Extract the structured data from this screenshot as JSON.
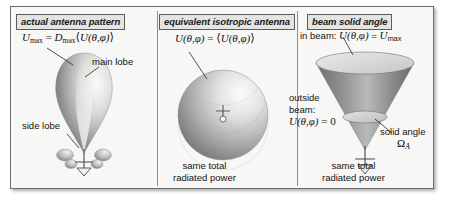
{
  "panels": [
    {
      "id": "actual-antenna-pattern",
      "heading": "actual antenna pattern",
      "formula": {
        "lhs_symbol": "U",
        "lhs_sub": "max",
        "equals": "=",
        "rhs_symbol": "D",
        "rhs_sub": "max",
        "average_open": "⟨",
        "average_arg": "U(θ,φ)",
        "average_close": "⟩",
        "full": "U_max = D_max ⟨U(θ,φ)⟩"
      },
      "labels": {
        "main_lobe": "main lobe",
        "side_lobe": "side lobe"
      },
      "caption": ""
    },
    {
      "id": "equivalent-isotropic-antenna",
      "heading": "equivalent isotropic antenna",
      "formula": {
        "lhs": "U(θ,φ)",
        "equals": "=",
        "average_open": "⟨",
        "average_arg": "U(θ,φ)",
        "average_close": "⟩",
        "full": "U(θ,φ) = ⟨U(θ,φ)⟩"
      },
      "caption_line1": "same total",
      "caption_line2": "radiated power"
    },
    {
      "id": "beam-solid-angle",
      "heading": "beam solid angle",
      "in_beam": {
        "prefix": "in beam: ",
        "expr": "U(θ,φ)",
        "equals": " = ",
        "value_symbol": "U",
        "value_sub": "max",
        "full": "in beam: U(θ,φ) = U_max"
      },
      "outside_beam": {
        "line1": "outside",
        "line2": "beam:",
        "expr": "U(θ,φ)",
        "equals": " = 0",
        "full": "outside beam: U(θ,φ) = 0"
      },
      "solid_angle": {
        "label": "solid angle",
        "symbol": "Ω",
        "sub": "A"
      },
      "caption_line1": "same total",
      "caption_line2": "radiated power"
    }
  ],
  "colors": {
    "frame_border": "#6d6d6d",
    "panel_bg": "#f7f7f5",
    "chip_bg": "#e4e4e2",
    "chip_border": "#5c5c5c",
    "text": "#141414",
    "lobe_dark": "#6e6e6e",
    "lobe_light": "#f2f2f0",
    "leader": "#3a3a3a"
  }
}
